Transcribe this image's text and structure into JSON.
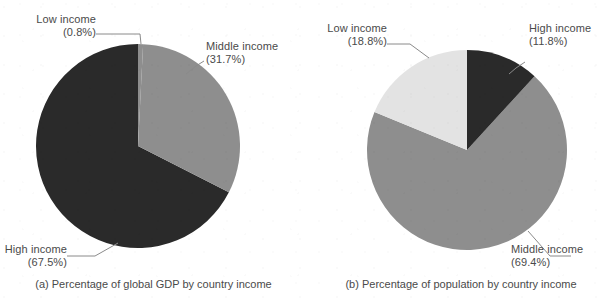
{
  "figure": {
    "background_color": "#ffffff",
    "text_color": "#4a4a4a"
  },
  "palette": {
    "dark": "#2a2a2a",
    "mid": "#8e8e8e",
    "light": "#e3e3e3",
    "leader_line": "#8a8a8a"
  },
  "chart_data": [
    {
      "type": "pie",
      "id": "panel-a",
      "title": "(a) Percentage of global GDP by country income",
      "caption": "(a) Percentage of global GDP by country income",
      "categories": [
        "Low income",
        "Middle income",
        "High income"
      ],
      "values": [
        0.8,
        31.7,
        67.5
      ],
      "labels": [
        "Low income (0.8%)",
        "Middle income (31.7%)",
        "High income (67.5%)"
      ],
      "colors": [
        "#8e8e8e",
        "#8e8e8e",
        "#2a2a2a"
      ],
      "start_angle_deg": 0,
      "direction": "clockwise",
      "legend": "none",
      "grid": false,
      "center": {
        "x": 138,
        "y": 146
      },
      "radius": 102,
      "slice_labels": [
        {
          "name": "Low income",
          "line1": "Low income",
          "line2": "(0.8%)",
          "percent": 0.8
        },
        {
          "name": "Middle income",
          "line1": "Middle income",
          "line2": "(31.7%)",
          "percent": 31.7
        },
        {
          "name": "High income",
          "line1": "High income",
          "line2": "(67.5%)",
          "percent": 67.5
        }
      ]
    },
    {
      "type": "pie",
      "id": "panel-b",
      "title": "(b) Percentage of population by country income",
      "caption": "(b) Percentage of population by country income",
      "categories": [
        "High income",
        "Middle income",
        "Low income"
      ],
      "values": [
        11.8,
        69.4,
        18.8
      ],
      "labels": [
        "High income (11.8%)",
        "Middle income (69.4%)",
        "Low income (18.8%)"
      ],
      "colors": [
        "#2a2a2a",
        "#8e8e8e",
        "#e3e3e3"
      ],
      "start_angle_deg": 0,
      "direction": "clockwise",
      "legend": "none",
      "grid": false,
      "center": {
        "x": 160,
        "y": 150
      },
      "radius": 100,
      "slice_labels": [
        {
          "name": "High income",
          "line1": "High income",
          "line2": "(11.8%)",
          "percent": 11.8
        },
        {
          "name": "Middle income",
          "line1": "Middle income",
          "line2": "(69.4%)",
          "percent": 69.4
        },
        {
          "name": "Low income",
          "line1": "Low income",
          "line2": "(18.8%)",
          "percent": 18.8
        }
      ]
    }
  ],
  "panel_a": {
    "caption": "(a) Percentage of global GDP by country income",
    "low": {
      "line1": "Low income",
      "line2": "(0.8%)"
    },
    "middle": {
      "line1": "Middle income",
      "line2": "(31.7%)"
    },
    "high": {
      "line1": "High income",
      "line2": "(67.5%)"
    }
  },
  "panel_b": {
    "caption": "(b) Percentage of population by country income",
    "low": {
      "line1": "Low income",
      "line2": "(18.8%)"
    },
    "middle": {
      "line1": "Middle income",
      "line2": "(69.4%)"
    },
    "high": {
      "line1": "High income",
      "line2": "(11.8%)"
    }
  }
}
